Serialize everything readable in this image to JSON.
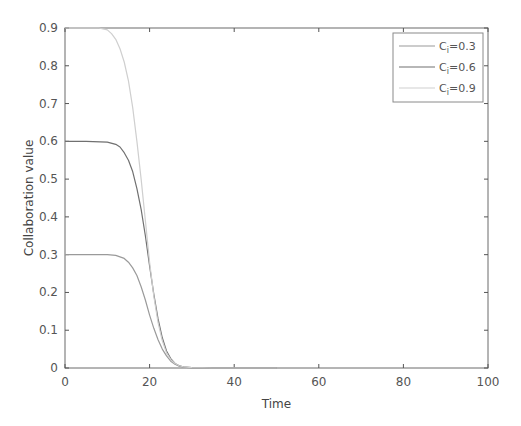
{
  "chart_data": {
    "type": "line",
    "title": "",
    "xlabel": "Time",
    "ylabel": "Collaboration value",
    "xlim": [
      0,
      100
    ],
    "ylim": [
      0,
      0.9
    ],
    "xticks": [
      0,
      20,
      40,
      60,
      80,
      100
    ],
    "xtick_labels": [
      "0",
      "20",
      "40",
      "60",
      "80",
      "100"
    ],
    "yticks": [
      0,
      0.1,
      0.2,
      0.3,
      0.4,
      0.5,
      0.6,
      0.7,
      0.8,
      0.9
    ],
    "ytick_labels": [
      "0",
      "0.1",
      "0.2",
      "0.3",
      "0.4",
      "0.5",
      "0.6",
      "0.7",
      "0.8",
      "0.9"
    ],
    "grid": false,
    "legend_position": "top-right",
    "series": [
      {
        "name": "C_i=0.3",
        "label_main": "C",
        "label_sub": "i",
        "label_value": "=0.3",
        "color": "#9a9a9a",
        "x": [
          0,
          5,
          10,
          12,
          14,
          15,
          16,
          17,
          18,
          19,
          20,
          21,
          22,
          23,
          24,
          25,
          26,
          27,
          28,
          30,
          35,
          40,
          45,
          50
        ],
        "y": [
          0.3,
          0.3,
          0.3,
          0.298,
          0.29,
          0.28,
          0.265,
          0.245,
          0.215,
          0.18,
          0.14,
          0.105,
          0.075,
          0.05,
          0.032,
          0.018,
          0.01,
          0.005,
          0.002,
          0.0005,
          0,
          0,
          0,
          0
        ]
      },
      {
        "name": "C_i=0.6",
        "label_main": "C",
        "label_sub": "i",
        "label_value": "=0.6",
        "color": "#707070",
        "x": [
          0,
          5,
          10,
          12,
          13,
          14,
          15,
          16,
          17,
          18,
          19,
          20,
          21,
          22,
          23,
          24,
          25,
          26,
          27,
          28,
          30,
          35,
          40,
          45,
          50
        ],
        "y": [
          0.6,
          0.6,
          0.598,
          0.592,
          0.585,
          0.57,
          0.55,
          0.52,
          0.475,
          0.42,
          0.35,
          0.27,
          0.195,
          0.13,
          0.08,
          0.045,
          0.025,
          0.012,
          0.006,
          0.003,
          0.001,
          0,
          0,
          0,
          0
        ]
      },
      {
        "name": "C_i=0.9",
        "label_main": "C",
        "label_sub": "i",
        "label_value": "=0.9",
        "color": "#cfcfcf",
        "x": [
          0,
          5,
          8,
          10,
          11,
          12,
          13,
          14,
          15,
          16,
          17,
          18,
          19,
          20,
          21,
          22,
          23,
          24,
          25,
          26,
          27,
          28,
          30,
          35,
          40,
          45,
          50
        ],
        "y": [
          0.9,
          0.9,
          0.9,
          0.895,
          0.885,
          0.87,
          0.845,
          0.81,
          0.76,
          0.69,
          0.6,
          0.5,
          0.39,
          0.28,
          0.19,
          0.12,
          0.072,
          0.04,
          0.022,
          0.012,
          0.006,
          0.003,
          0.001,
          0,
          0,
          0,
          0
        ]
      }
    ]
  }
}
